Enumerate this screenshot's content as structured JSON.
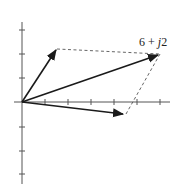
{
  "diagram": {
    "type": "complex-plane-vector-addition",
    "origin_px": [
      22,
      102
    ],
    "unit_px": 23,
    "axes": {
      "x_ticks": [
        1,
        2,
        3,
        4,
        5,
        6
      ],
      "y_ticks": [
        3,
        2,
        1,
        -1,
        -2,
        -3
      ]
    },
    "vectors": [
      {
        "name": "vector-a",
        "re": 1.5,
        "im": 2.3
      },
      {
        "name": "vector-sum",
        "re": 6,
        "im": 2,
        "label": "6 + j2"
      },
      {
        "name": "vector-b",
        "re": 4.5,
        "im": -0.5
      }
    ],
    "label": {
      "real": "6 + ",
      "imag_unit": "j",
      "imag": "2"
    },
    "colors": {
      "axis": "#555555",
      "vector": "#1a1a1a",
      "dashed": "#555555"
    }
  }
}
